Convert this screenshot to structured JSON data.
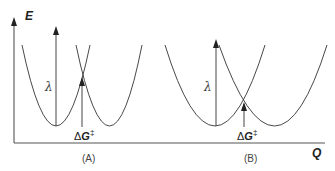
{
  "diagram": {
    "type": "marcus-parabolas",
    "axes": {
      "y_label": "E",
      "x_label": "Q"
    },
    "panels": [
      {
        "id": "A",
        "label": "(A)",
        "lambda_label": "λ",
        "barrier_label_prefix": "Δ",
        "barrier_label_main": "G",
        "barrier_label_sup": "‡"
      },
      {
        "id": "B",
        "label": "(B)",
        "lambda_label": "λ",
        "barrier_label_prefix": "Δ",
        "barrier_label_main": "G",
        "barrier_label_sup": "‡"
      }
    ],
    "colors": {
      "line": "#333333",
      "background": "#ffffff"
    }
  }
}
